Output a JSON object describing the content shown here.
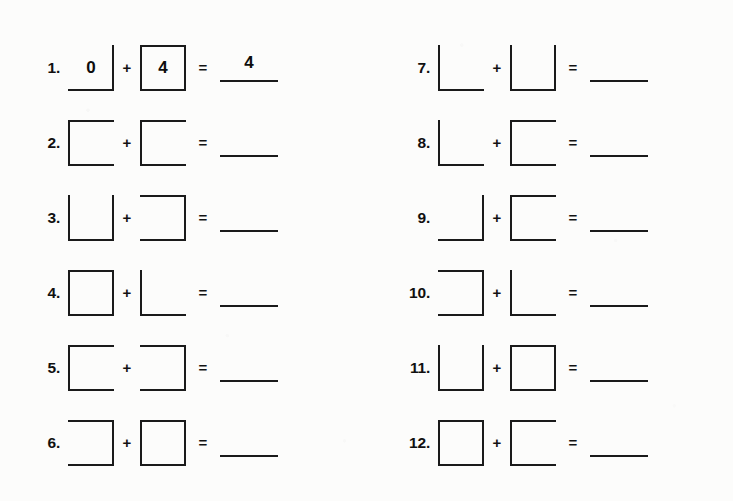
{
  "worksheet": {
    "background_color": "#fcfcfb",
    "ink_color": "#1a1a1a",
    "plus_symbol": "+",
    "equals_symbol": "=",
    "columns": [
      {
        "name": "left-column",
        "problems": [
          {
            "number": "1.",
            "operand_a": {
              "shape": "right-bottom-corner",
              "edges": [
                "right",
                "bottom"
              ],
              "value": "0"
            },
            "operand_b": {
              "shape": "full-square",
              "edges": [
                "top",
                "right",
                "bottom",
                "left"
              ],
              "value": "4"
            },
            "answer": "4"
          },
          {
            "number": "2.",
            "operand_a": {
              "shape": "c-open-right",
              "edges": [
                "top",
                "left",
                "bottom"
              ],
              "value": ""
            },
            "operand_b": {
              "shape": "c-open-right",
              "edges": [
                "top",
                "left",
                "bottom"
              ],
              "value": ""
            },
            "answer": ""
          },
          {
            "number": "3.",
            "operand_a": {
              "shape": "u-open-top",
              "edges": [
                "left",
                "bottom",
                "right"
              ],
              "value": ""
            },
            "operand_b": {
              "shape": "c-open-left",
              "edges": [
                "top",
                "right",
                "bottom"
              ],
              "value": ""
            },
            "answer": ""
          },
          {
            "number": "4.",
            "operand_a": {
              "shape": "full-square",
              "edges": [
                "top",
                "right",
                "bottom",
                "left"
              ],
              "value": ""
            },
            "operand_b": {
              "shape": "l-corner",
              "edges": [
                "left",
                "bottom"
              ],
              "value": ""
            },
            "answer": ""
          },
          {
            "number": "5.",
            "operand_a": {
              "shape": "c-open-right",
              "edges": [
                "top",
                "left",
                "bottom"
              ],
              "value": ""
            },
            "operand_b": {
              "shape": "c-open-left",
              "edges": [
                "top",
                "right",
                "bottom"
              ],
              "value": ""
            },
            "answer": ""
          },
          {
            "number": "6.",
            "operand_a": {
              "shape": "c-open-left",
              "edges": [
                "top",
                "right",
                "bottom"
              ],
              "value": ""
            },
            "operand_b": {
              "shape": "full-square",
              "edges": [
                "top",
                "right",
                "bottom",
                "left"
              ],
              "value": ""
            },
            "answer": ""
          }
        ]
      },
      {
        "name": "right-column",
        "problems": [
          {
            "number": "7.",
            "operand_a": {
              "shape": "l-corner",
              "edges": [
                "left",
                "bottom"
              ],
              "value": ""
            },
            "operand_b": {
              "shape": "u-open-top",
              "edges": [
                "left",
                "bottom",
                "right"
              ],
              "value": ""
            },
            "answer": ""
          },
          {
            "number": "8.",
            "operand_a": {
              "shape": "l-corner",
              "edges": [
                "left",
                "bottom"
              ],
              "value": ""
            },
            "operand_b": {
              "shape": "c-open-right",
              "edges": [
                "top",
                "left",
                "bottom"
              ],
              "value": ""
            },
            "answer": ""
          },
          {
            "number": "9.",
            "operand_a": {
              "shape": "right-bottom-corner",
              "edges": [
                "right",
                "bottom"
              ],
              "value": ""
            },
            "operand_b": {
              "shape": "c-open-right",
              "edges": [
                "top",
                "left",
                "bottom"
              ],
              "value": ""
            },
            "answer": ""
          },
          {
            "number": "10.",
            "operand_a": {
              "shape": "c-open-left",
              "edges": [
                "top",
                "right",
                "bottom"
              ],
              "value": ""
            },
            "operand_b": {
              "shape": "l-corner",
              "edges": [
                "left",
                "bottom"
              ],
              "value": ""
            },
            "answer": ""
          },
          {
            "number": "11.",
            "operand_a": {
              "shape": "u-open-top",
              "edges": [
                "left",
                "bottom",
                "right"
              ],
              "value": ""
            },
            "operand_b": {
              "shape": "full-square",
              "edges": [
                "top",
                "right",
                "bottom",
                "left"
              ],
              "value": ""
            },
            "answer": ""
          },
          {
            "number": "12.",
            "operand_a": {
              "shape": "full-square",
              "edges": [
                "top",
                "right",
                "bottom",
                "left"
              ],
              "value": ""
            },
            "operand_b": {
              "shape": "c-open-right",
              "edges": [
                "top",
                "left",
                "bottom"
              ],
              "value": ""
            },
            "answer": ""
          }
        ]
      }
    ]
  }
}
